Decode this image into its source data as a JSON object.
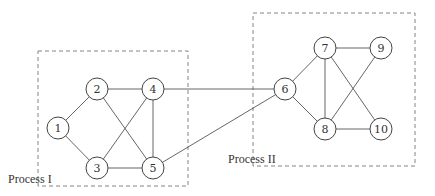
{
  "groups": [
    {
      "id": "process-1",
      "label": "Process I",
      "box": {
        "x": 38,
        "y": 51,
        "w": 150,
        "h": 135
      },
      "label_pos": {
        "x": 8,
        "y": 183
      }
    },
    {
      "id": "process-2",
      "label": "Process II",
      "box": {
        "x": 253,
        "y": 13,
        "w": 162,
        "h": 153
      },
      "label_pos": {
        "x": 228,
        "y": 163
      }
    }
  ],
  "nodes": [
    {
      "id": "1",
      "label": "1",
      "x": 58,
      "y": 128
    },
    {
      "id": "2",
      "label": "2",
      "x": 97,
      "y": 89
    },
    {
      "id": "3",
      "label": "3",
      "x": 97,
      "y": 168
    },
    {
      "id": "4",
      "label": "4",
      "x": 153,
      "y": 89
    },
    {
      "id": "5",
      "label": "5",
      "x": 153,
      "y": 168
    },
    {
      "id": "6",
      "label": "6",
      "x": 285,
      "y": 89
    },
    {
      "id": "7",
      "label": "7",
      "x": 325,
      "y": 48
    },
    {
      "id": "8",
      "label": "8",
      "x": 325,
      "y": 129
    },
    {
      "id": "9",
      "label": "9",
      "x": 381,
      "y": 48
    },
    {
      "id": "10",
      "label": "10",
      "x": 381,
      "y": 129
    }
  ],
  "edges": [
    [
      "1",
      "2"
    ],
    [
      "1",
      "3"
    ],
    [
      "2",
      "4"
    ],
    [
      "2",
      "5"
    ],
    [
      "3",
      "4"
    ],
    [
      "3",
      "5"
    ],
    [
      "4",
      "5"
    ],
    [
      "4",
      "6"
    ],
    [
      "5",
      "6"
    ],
    [
      "6",
      "7"
    ],
    [
      "6",
      "8"
    ],
    [
      "7",
      "8"
    ],
    [
      "7",
      "9"
    ],
    [
      "7",
      "10"
    ],
    [
      "8",
      "9"
    ],
    [
      "8",
      "10"
    ]
  ],
  "node_radius": 11
}
